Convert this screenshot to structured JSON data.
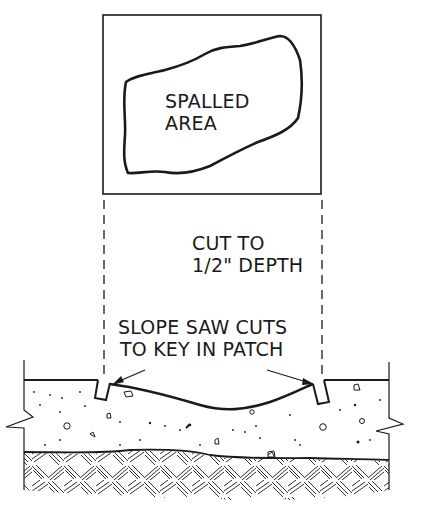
{
  "diagram": {
    "type": "concrete spall repair cross-section",
    "plan_view": {
      "label_line1": "SPALLED",
      "label_line2": "AREA"
    },
    "callouts": {
      "cut_depth_line1": "CUT TO",
      "cut_depth_line2": "1/2\" DEPTH",
      "slope_line1": "SLOPE SAW CUTS",
      "slope_line2": "TO KEY IN PATCH"
    },
    "colors": {
      "ink": "#1a1a1a",
      "background": "#ffffff"
    }
  }
}
